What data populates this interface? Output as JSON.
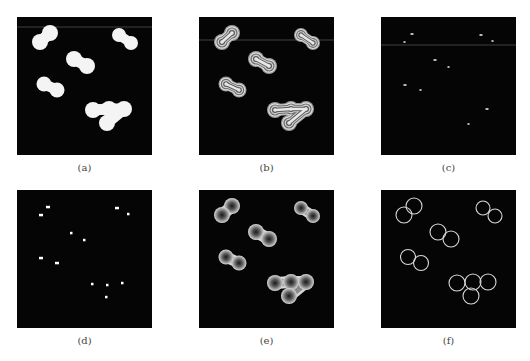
{
  "figure": {
    "panels": [
      {
        "id": "a",
        "caption": "(a)",
        "x": 17,
        "y": 17,
        "type": "filled"
      },
      {
        "id": "b",
        "caption": "(b)",
        "x": 199,
        "y": 17,
        "type": "ringed"
      },
      {
        "id": "c",
        "caption": "(c)",
        "x": 381,
        "y": 17,
        "type": "sparse-dots"
      },
      {
        "id": "d",
        "caption": "(d)",
        "x": 17,
        "y": 190,
        "type": "dots"
      },
      {
        "id": "e",
        "caption": "(e)",
        "x": 199,
        "y": 190,
        "type": "distance-map"
      },
      {
        "id": "f",
        "caption": "(f)",
        "x": 381,
        "y": 190,
        "type": "outlines"
      }
    ],
    "blobs": [
      {
        "circles": [
          [
            33,
            16,
            8
          ],
          [
            23,
            25,
            8
          ]
        ]
      },
      {
        "circles": [
          [
            102,
            18,
            7
          ],
          [
            114,
            26,
            7
          ]
        ]
      },
      {
        "circles": [
          [
            57,
            42,
            8
          ],
          [
            70,
            49,
            8
          ]
        ]
      },
      {
        "circles": [
          [
            27,
            67,
            7.5
          ],
          [
            40,
            73,
            7.5
          ]
        ]
      },
      {
        "circles": [
          [
            76,
            93,
            8
          ],
          [
            92,
            92,
            8
          ],
          [
            107,
            92,
            8
          ],
          [
            90,
            106,
            8
          ]
        ]
      }
    ],
    "dots_d": [
      [
        31,
        17
      ],
      [
        24,
        25
      ],
      [
        100,
        18
      ],
      [
        112,
        24
      ],
      [
        55,
        43
      ],
      [
        68,
        50
      ],
      [
        24,
        68
      ],
      [
        40,
        73
      ],
      [
        76,
        94
      ],
      [
        91,
        95
      ],
      [
        106,
        93
      ],
      [
        90,
        107
      ]
    ],
    "dots_c": [
      [
        31,
        17
      ],
      [
        24,
        25
      ],
      [
        100,
        18
      ],
      [
        112,
        24
      ],
      [
        54,
        43
      ],
      [
        68,
        50
      ],
      [
        24,
        68
      ],
      [
        40,
        73
      ],
      [
        106,
        92
      ],
      [
        88,
        107
      ]
    ],
    "colors": {
      "background": "#050505",
      "blob_fill": "#f4f4f4",
      "outline": "#d8d8d8",
      "ring_light": "#cfcfcf",
      "ring_mid": "#7a7a7a",
      "dot": "#ffffff"
    }
  }
}
